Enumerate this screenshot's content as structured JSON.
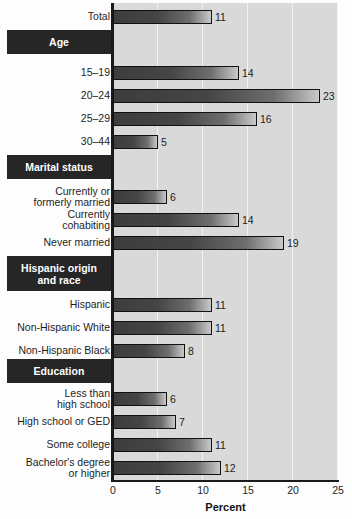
{
  "chart_data": {
    "type": "bar",
    "orientation": "horizontal",
    "title": "",
    "xlabel": "Percent",
    "ylabel": "",
    "xlim": [
      0,
      25
    ],
    "xticks": [
      0,
      5,
      10,
      15,
      20,
      25
    ],
    "xticklabels": [
      "0",
      "5",
      "10",
      "15",
      "20",
      "25"
    ],
    "grid": true,
    "legend": false,
    "categories": [
      "Total",
      "15–19",
      "20–24",
      "25–29",
      "30–44",
      "Currently or\nformerly married",
      "Currently\ncohabiting",
      "Never married",
      "Hispanic",
      "Non-Hispanic White",
      "Non-Hispanic Black",
      "Less than\nhigh school",
      "High school or GED",
      "Some college",
      "Bachelor's degree\nor higher"
    ],
    "values": [
      11,
      14,
      23,
      16,
      5,
      6,
      14,
      19,
      11,
      11,
      8,
      6,
      7,
      11,
      12
    ],
    "data_labels": [
      "11",
      "14",
      "23",
      "16",
      "5",
      "6",
      "14",
      "19",
      "11",
      "11",
      "8",
      "6",
      "7",
      "11",
      "12"
    ],
    "group_headers": [
      "Age",
      "Marital status",
      "Hispanic origin\nand race",
      "Education"
    ],
    "colors": {
      "bar_dark": "#3d3d3d",
      "bar_light": "#c9c9c9",
      "bar_outline": "#111111",
      "plot_background": "#d9d9d9",
      "gridline": "#f2f2f2",
      "axis": "#1a1a1a",
      "header_background": "#262626",
      "header_text": "#ffffff",
      "text": "#1d1d1d"
    }
  },
  "rows": [
    {
      "label": "Total",
      "value": 11,
      "data_label": "11",
      "top": 10,
      "kind": "bar"
    },
    {
      "label": "Age",
      "top": 30,
      "height": 24,
      "kind": "header"
    },
    {
      "label": "15–19",
      "value": 14,
      "data_label": "14",
      "top": 66,
      "kind": "bar"
    },
    {
      "label": "20–24",
      "value": 23,
      "data_label": "23",
      "top": 89,
      "kind": "bar"
    },
    {
      "label": "25–29",
      "value": 16,
      "data_label": "16",
      "top": 112,
      "kind": "bar"
    },
    {
      "label": "30–44",
      "value": 5,
      "data_label": "5",
      "top": 135,
      "kind": "bar"
    },
    {
      "label": "Marital status",
      "top": 155,
      "height": 24,
      "kind": "header"
    },
    {
      "label": "Currently or\nformerly married",
      "value": 6,
      "data_label": "6",
      "top": 190,
      "kind": "bar"
    },
    {
      "label": "Currently\ncohabiting",
      "value": 14,
      "data_label": "14",
      "top": 213,
      "kind": "bar"
    },
    {
      "label": "Never married",
      "value": 19,
      "data_label": "19",
      "top": 236,
      "kind": "bar"
    },
    {
      "label": "Hispanic origin\nand race",
      "top": 256,
      "height": 35,
      "kind": "header"
    },
    {
      "label": "Hispanic",
      "value": 11,
      "data_label": "11",
      "top": 298,
      "kind": "bar"
    },
    {
      "label": "Non-Hispanic White",
      "value": 11,
      "data_label": "11",
      "top": 321,
      "kind": "bar"
    },
    {
      "label": "Non-Hispanic Black",
      "value": 8,
      "data_label": "8",
      "top": 344,
      "kind": "bar"
    },
    {
      "label": "Education",
      "top": 359,
      "height": 24,
      "kind": "header"
    },
    {
      "label": "Less than\nhigh school",
      "value": 6,
      "data_label": "6",
      "top": 392,
      "kind": "bar"
    },
    {
      "label": "High school or GED",
      "value": 7,
      "data_label": "7",
      "top": 415,
      "kind": "bar"
    },
    {
      "label": "Some college",
      "value": 11,
      "data_label": "11",
      "top": 438,
      "kind": "bar"
    },
    {
      "label": "Bachelor's degree\nor higher",
      "value": 12,
      "data_label": "12",
      "top": 461,
      "kind": "bar"
    }
  ],
  "axis": {
    "title": "Percent",
    "ticks": [
      "0",
      "5",
      "10",
      "15",
      "20",
      "25"
    ],
    "tick_values": [
      0,
      5,
      10,
      15,
      20,
      25
    ],
    "max": 25
  }
}
